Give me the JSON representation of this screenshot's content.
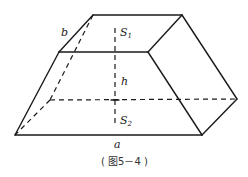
{
  "figure": {
    "caption": "( 图5－4 )",
    "shape": "frustum-like prismatoid (truncated wedge)",
    "labels": {
      "b": "b",
      "s1_main": "S",
      "s1_sub": "1",
      "h": "h",
      "s2_main": "S",
      "s2_sub": "2",
      "a": "a"
    },
    "colors": {
      "stroke": "#1a1a1a",
      "background": "#ffffff"
    }
  }
}
